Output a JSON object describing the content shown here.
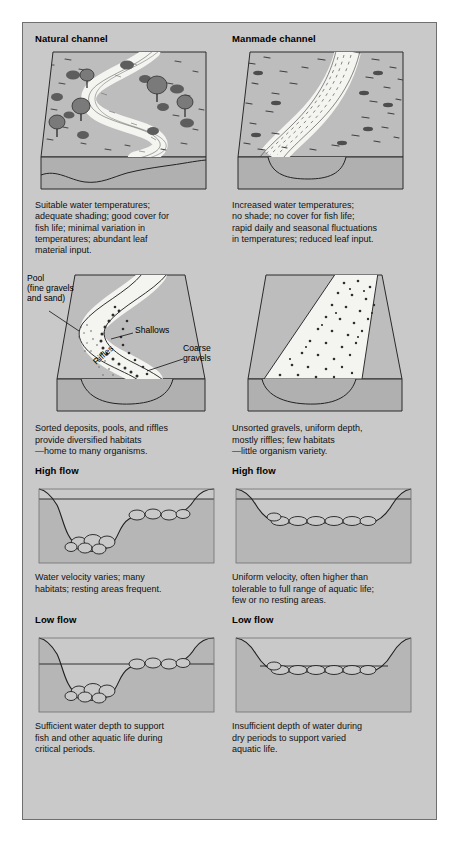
{
  "figure": {
    "background_color": "#c9c9c9",
    "border_color": "#6f6f6f",
    "water_color": "#f2f2ef",
    "ground_color": "#b8b8b8",
    "ground_shadow_color": "#a2a2a2"
  },
  "columns": [
    {
      "id": "natural",
      "title": "Natural channel"
    },
    {
      "id": "manmade",
      "title": "Manmade channel"
    }
  ],
  "rows": [
    {
      "id": "plan-view",
      "natural": {
        "caption": [
          "Suitable water temperatures;",
          "adequate shading; good cover for",
          "fish life; minimal variation in",
          "temperatures; abundant leaf",
          "material input."
        ]
      },
      "manmade": {
        "caption": [
          "Increased water temperatures;",
          "no shade; no cover for fish life;",
          "rapid daily and seasonal fluctuations",
          "in temperatures; reduced leaf input."
        ]
      }
    },
    {
      "id": "bed-deposits",
      "natural": {
        "annotations": [
          {
            "name": "pool-label",
            "text": "Pool\n(fine gravels\nand sand)"
          },
          {
            "name": "shallows-label",
            "text": "Shallows"
          },
          {
            "name": "riffles-label",
            "text": "Riffles"
          },
          {
            "name": "coarse-gravels-label",
            "text": "Coarse\ngravels"
          }
        ],
        "caption": [
          "Sorted deposits, pools, and riffles",
          "provide diversified habitats",
          "—home to many organisms."
        ]
      },
      "manmade": {
        "annotations": [],
        "caption": [
          "Unsorted gravels, uniform depth,",
          "mostly riffles; few habitats",
          "—little organism variety."
        ]
      }
    },
    {
      "id": "high-flow",
      "natural": {
        "subtitle": "High flow",
        "caption": [
          "Water velocity varies; many",
          "habitats; resting areas frequent."
        ]
      },
      "manmade": {
        "subtitle": "High flow",
        "caption": [
          "Uniform velocity, often higher than",
          "tolerable to full range of aquatic life;",
          "few or no resting areas."
        ]
      }
    },
    {
      "id": "low-flow",
      "natural": {
        "subtitle": "Low flow",
        "caption": [
          "Sufficient water depth to support",
          "fish and other aquatic life during",
          "critical periods."
        ]
      },
      "manmade": {
        "subtitle": "Low flow",
        "caption": [
          "Insufficient depth of water during",
          "dry periods to support varied",
          "aquatic life."
        ]
      }
    }
  ]
}
